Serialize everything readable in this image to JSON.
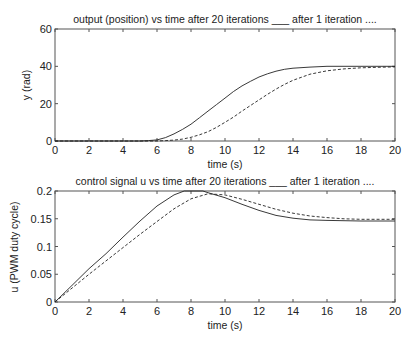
{
  "chart_data": [
    {
      "type": "line",
      "title": "output (position) vs time after 20 iterations ___ after 1 iteration ....",
      "xlabel": "time (s)",
      "ylabel": "y (rad)",
      "xlim": [
        0,
        20
      ],
      "ylim": [
        0,
        60
      ],
      "xticks": [
        "0",
        "2",
        "4",
        "6",
        "8",
        "10",
        "12",
        "14",
        "16",
        "18",
        "20"
      ],
      "yticks": [
        "0",
        "20",
        "40",
        "60"
      ],
      "grid": false,
      "series": [
        {
          "name": "after 20 iterations",
          "style": "solid",
          "x": [
            0,
            5,
            5.5,
            6,
            6.5,
            7,
            7.5,
            8,
            8.5,
            9,
            9.5,
            10,
            10.5,
            11,
            11.5,
            12,
            12.5,
            13,
            13.5,
            14,
            15,
            16,
            18,
            20
          ],
          "y": [
            0,
            0,
            0.2,
            0.6,
            1.8,
            3.8,
            6.2,
            9,
            12.5,
            16,
            19.5,
            23,
            26.5,
            29.5,
            32,
            34.3,
            36,
            37.4,
            38.4,
            39,
            39.6,
            40,
            40,
            40
          ]
        },
        {
          "name": "after 1 iteration",
          "style": "dashed",
          "x": [
            0,
            6,
            6.5,
            7,
            7.5,
            8,
            8.5,
            9,
            9.5,
            10,
            10.5,
            11,
            11.5,
            12,
            12.5,
            13,
            13.5,
            14,
            15,
            16,
            17,
            18,
            19,
            20
          ],
          "y": [
            0,
            0,
            0.2,
            0.5,
            1,
            2,
            3.3,
            5,
            7.3,
            10,
            12.8,
            16,
            19,
            22,
            25,
            27.8,
            30.3,
            32.5,
            35.8,
            37.6,
            38.6,
            39.2,
            39.5,
            39.7
          ]
        }
      ]
    },
    {
      "type": "line",
      "title": "control signal u vs time after 20 iterations ___ after 1 iteration ....",
      "xlabel": "time (s)",
      "ylabel": "u (PWM duty cycle)",
      "xlim": [
        0,
        20
      ],
      "ylim": [
        0,
        0.2
      ],
      "xticks": [
        "0",
        "2",
        "4",
        "6",
        "8",
        "10",
        "12",
        "14",
        "16",
        "18",
        "20"
      ],
      "yticks": [
        "0",
        "0.05",
        "0.1",
        "0.15",
        "0.2"
      ],
      "grid": false,
      "series": [
        {
          "name": "after 20 iterations",
          "style": "solid",
          "x": [
            0,
            1,
            2,
            3,
            4,
            5,
            6,
            7,
            7.6,
            8.7,
            9,
            10,
            11,
            12,
            13,
            14,
            15,
            16,
            18,
            20
          ],
          "y": [
            0,
            0.03,
            0.06,
            0.087,
            0.117,
            0.146,
            0.173,
            0.193,
            0.2,
            0.2,
            0.197,
            0.188,
            0.176,
            0.165,
            0.156,
            0.151,
            0.148,
            0.147,
            0.146,
            0.146
          ]
        },
        {
          "name": "after 1 iteration",
          "style": "dashed",
          "x": [
            0,
            1,
            2,
            3,
            4,
            5,
            6,
            7,
            8,
            9,
            10,
            11,
            12,
            13,
            14,
            15,
            16,
            17,
            18,
            20
          ],
          "y": [
            0,
            0.025,
            0.05,
            0.074,
            0.098,
            0.122,
            0.145,
            0.168,
            0.186,
            0.195,
            0.193,
            0.185,
            0.176,
            0.167,
            0.16,
            0.155,
            0.152,
            0.15,
            0.149,
            0.149
          ]
        }
      ]
    }
  ]
}
